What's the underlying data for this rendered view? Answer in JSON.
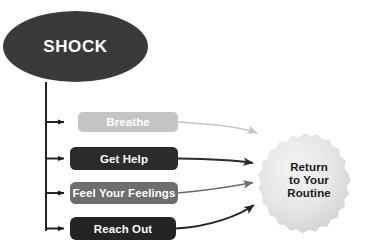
{
  "diagram": {
    "background_color": "#ffffff",
    "source": {
      "id": "shock",
      "label": "SHOCK",
      "shape": "ellipse",
      "fill": "#3a3a3a",
      "text_color": "#ffffff"
    },
    "steps": [
      {
        "id": "breathe",
        "label": "Breathe",
        "shape": "rounded-rect",
        "fill": "#c4c4c4",
        "text_color": "#ffffff",
        "arrow_color": "#c4c4c4"
      },
      {
        "id": "get-help",
        "label": "Get Help",
        "shape": "rounded-rect",
        "fill": "#2b2b2b",
        "text_color": "#ffffff",
        "arrow_color": "#2b2b2b"
      },
      {
        "id": "feel-your-feelings",
        "label": "Feel Your Feelings",
        "shape": "rounded-rect",
        "fill": "#6e6e6e",
        "text_color": "#ffffff",
        "arrow_color": "#6e6e6e"
      },
      {
        "id": "reach-out",
        "label": "Reach Out",
        "shape": "rounded-rect",
        "fill": "#242424",
        "text_color": "#ffffff",
        "arrow_color": "#242424"
      }
    ],
    "outcome": {
      "id": "return-to-your-routine",
      "shape": "starburst",
      "fill": "#e3e3e3",
      "text_color": "#1a1a1a",
      "lines": [
        "Return",
        "to Your",
        "Routine"
      ],
      "line1": "Return",
      "line2": "to Your",
      "line3": "Routine"
    },
    "connector": {
      "spine_color": "#1a1a1a",
      "description": "vertical spine from source ellipse with four horizontal arrow stubs to each step"
    }
  }
}
